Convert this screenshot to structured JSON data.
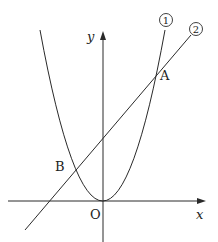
{
  "diagram": {
    "axes": {
      "x_label": "x",
      "y_label": "y",
      "origin_label": "O"
    },
    "curves": [
      {
        "id": "1",
        "marker": "①",
        "kind": "parabola",
        "description": "upward parabola with vertex at origin"
      },
      {
        "id": "2",
        "marker": "②",
        "kind": "line",
        "description": "straight line with positive slope and positive y-intercept"
      }
    ],
    "points": [
      {
        "label": "A",
        "description": "intersection of ① and ② with x > 0"
      },
      {
        "label": "B",
        "description": "intersection of ① and ② with x < 0"
      }
    ],
    "colors": {
      "stroke": "#2a2a2a",
      "background": "#ffffff"
    }
  }
}
